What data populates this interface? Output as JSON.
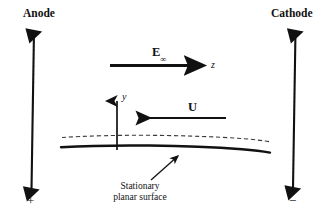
{
  "figure": {
    "electrodes": {
      "anode": {
        "label": "Anode",
        "sign": "+"
      },
      "cathode": {
        "label": "Cathode",
        "sign": "−"
      }
    },
    "field_arrow": {
      "symbol": "E",
      "subscript": "∞",
      "axis_label": "z",
      "direction": "right"
    },
    "velocity_arrow": {
      "label": "U",
      "direction": "left"
    },
    "vertical_axis": {
      "label": "y",
      "direction": "up"
    },
    "surface": {
      "caption_line1": "Stationary",
      "caption_line2": "planar surface"
    },
    "colors": {
      "ink": "#111111",
      "background": "#ffffff",
      "dashed": "#3a3a3a"
    }
  }
}
